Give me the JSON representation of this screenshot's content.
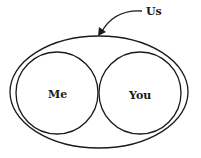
{
  "diagram": {
    "outer_label": "Us",
    "left_label": "Me",
    "right_label": "You",
    "stroke_color": "#1a1a1a",
    "background": "#ffffff"
  }
}
